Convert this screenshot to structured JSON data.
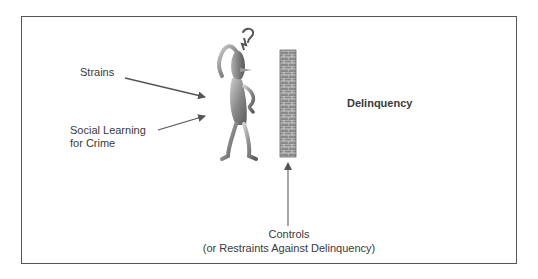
{
  "diagram": {
    "inputs": [
      {
        "id": "strains",
        "label": "Strains"
      },
      {
        "id": "social_learning",
        "label_line1": "Social Learning",
        "label_line2": "for Crime"
      }
    ],
    "outcome": {
      "label": "Delinquency"
    },
    "controls": {
      "label_line1": "Controls",
      "label_line2": "(or Restraints Against Delinquency)"
    },
    "figure": {
      "icon": "confused-stick-figure-icon",
      "mark": "question-mark"
    },
    "barrier": {
      "icon": "brick-wall-icon"
    },
    "colors": {
      "frame": "#555555",
      "arrow": "#555555",
      "text": "#3a3a3a",
      "wall": "#7a7a7a"
    }
  }
}
